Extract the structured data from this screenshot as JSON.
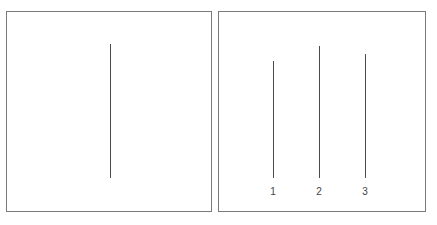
{
  "figure": {
    "reference_card": {
      "line": {
        "x": 110,
        "y_top": 44,
        "y_bottom": 178
      }
    },
    "comparison_card": {
      "lines": [
        {
          "label": "1",
          "x": 273,
          "y_top": 61,
          "y_bottom": 178
        },
        {
          "label": "2",
          "x": 319,
          "y_top": 46,
          "y_bottom": 178
        },
        {
          "label": "3",
          "x": 365,
          "y_top": 54,
          "y_bottom": 178
        }
      ]
    },
    "colors": {
      "border": "#7a7a7a",
      "line": "#4a4a4a",
      "label": "#444444"
    }
  }
}
